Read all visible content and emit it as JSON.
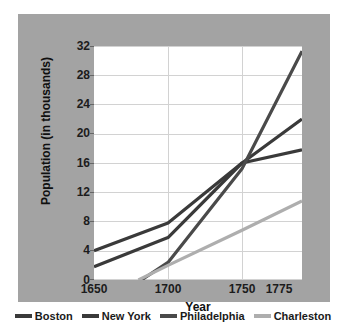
{
  "chart_data": {
    "type": "line",
    "title": "",
    "xlabel": "Year",
    "ylabel": "Population (in thousands)",
    "x": [
      1650,
      1700,
      1750,
      1775
    ],
    "x_tick_labels": [
      "1650",
      "1700",
      "1750",
      "1775"
    ],
    "y_tick_labels": [
      "0",
      "4",
      "8",
      "12",
      "16",
      "20",
      "24",
      "28",
      "32"
    ],
    "y_ticks": [
      0,
      4,
      8,
      12,
      16,
      20,
      24,
      28,
      32
    ],
    "ylim": [
      0,
      32
    ],
    "grid": "horizontal-and-vertical",
    "legend_position": "bottom",
    "series": [
      {
        "name": "Boston",
        "color": "#3a3a3a",
        "x": [
          1650,
          1700,
          1750,
          1775
        ],
        "values": [
          4.0,
          7.8,
          16.0,
          17.8
        ]
      },
      {
        "name": "New York",
        "color": "#3a3a3a",
        "x": [
          1650,
          1700,
          1750,
          1775
        ],
        "values": [
          1.8,
          5.8,
          16.0,
          22.0
        ]
      },
      {
        "name": "Philadelphia",
        "color": "#4a4a4a",
        "x": [
          1682,
          1700,
          1750,
          1775
        ],
        "values": [
          0.0,
          2.4,
          15.2,
          31.3
        ]
      },
      {
        "name": "Charleston",
        "color": "#aeaeae",
        "x": [
          1680,
          1700,
          1750,
          1775
        ],
        "values": [
          0.0,
          2.0,
          6.8,
          10.8
        ]
      }
    ]
  },
  "legend": {
    "items": [
      {
        "label": "Boston",
        "color": "#3a3a3a"
      },
      {
        "label": "New York",
        "color": "#3a3a3a"
      },
      {
        "label": "Philadelphia",
        "color": "#4a4a4a"
      },
      {
        "label": "Charleston",
        "color": "#aeaeae"
      }
    ]
  },
  "colors": {
    "panel_background": "#a3a3a3",
    "plot_background": "#ffffff",
    "gridline": "#d2d2d2",
    "text": "#1c1c1c"
  }
}
